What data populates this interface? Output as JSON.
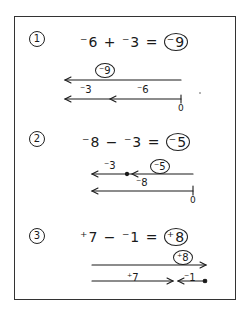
{
  "worksheet": {
    "problems": [
      {
        "number": "1",
        "equation": "⁻6 + ⁻3 = ",
        "answer": "⁻9",
        "diagram": {
          "result_label": "⁻9",
          "segment_labels": [
            "⁻3",
            "⁻6"
          ],
          "origin_label": "0"
        }
      },
      {
        "number": "2",
        "equation": "⁻8 − ⁻3 = ",
        "answer": "⁻5",
        "diagram": {
          "result_label": "⁻5",
          "segment_labels": [
            "⁻3",
            "⁻8"
          ],
          "origin_label": "0"
        }
      },
      {
        "number": "3",
        "equation": "⁺7 − ⁻1 = ",
        "answer": "⁺8",
        "diagram": {
          "result_label": "⁺8",
          "segment_labels": [
            "⁺7",
            "⁻1"
          ]
        }
      }
    ]
  }
}
